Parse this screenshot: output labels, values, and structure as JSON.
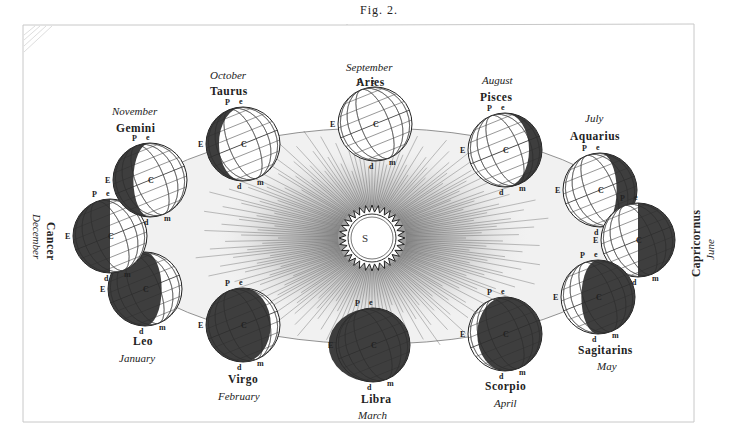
{
  "figure": {
    "title": "Fig. 2.",
    "sun_label": "S",
    "colors": {
      "background": "#ffffff",
      "ink": "#222222",
      "shade": "#2e2e2e",
      "frame": "#bdbdbd"
    },
    "point_labels": {
      "pole": "P",
      "ecliptic_pole": "e",
      "equator": "E",
      "center": "C",
      "d": "d",
      "m": "m"
    }
  },
  "positions": [
    {
      "month": "September",
      "sign": "Aries",
      "cx": 375,
      "cy": 124,
      "dark": "none"
    },
    {
      "month": "August",
      "sign": "Pisces",
      "cx": 505,
      "cy": 150,
      "dark": "right-crescent"
    },
    {
      "month": "July",
      "sign": "Aquarius",
      "cx": 600,
      "cy": 190,
      "dark": "right-third"
    },
    {
      "month": "June",
      "sign": "Capricornus",
      "cx": 638,
      "cy": 240,
      "dark": "right-half"
    },
    {
      "month": "May",
      "sign": "Sagitarins",
      "cx": 598,
      "cy": 297,
      "dark": "right-twothirds"
    },
    {
      "month": "April",
      "sign": "Scorpio",
      "cx": 505,
      "cy": 334,
      "dark": "mostly"
    },
    {
      "month": "March",
      "sign": "Libra",
      "cx": 373,
      "cy": 345,
      "dark": "full"
    },
    {
      "month": "February",
      "sign": "Virgo",
      "cx": 243,
      "cy": 325,
      "dark": "mostly-left"
    },
    {
      "month": "January",
      "sign": "Leo",
      "cx": 145,
      "cy": 289,
      "dark": "left-twothirds"
    },
    {
      "month": "December",
      "sign": "Cancer",
      "cx": 110,
      "cy": 236,
      "dark": "left-half"
    },
    {
      "month": "November",
      "sign": "Gemini",
      "cx": 150,
      "cy": 180,
      "dark": "left-third"
    },
    {
      "month": "October",
      "sign": "Taurus",
      "cx": 243,
      "cy": 144,
      "dark": "left-crescent"
    }
  ],
  "labels": {
    "september": {
      "month": "September",
      "sign": "Aries"
    },
    "august": {
      "month": "August",
      "sign": "Pisces"
    },
    "july": {
      "month": "July",
      "sign": "Aquarius"
    },
    "june": {
      "month": "June",
      "sign": "Capricornus"
    },
    "may": {
      "month": "May",
      "sign": "Sagitarins"
    },
    "april": {
      "month": "April",
      "sign": "Scorpio"
    },
    "march": {
      "month": "March",
      "sign": "Libra"
    },
    "february": {
      "month": "February",
      "sign": "Virgo"
    },
    "january": {
      "month": "January",
      "sign": "Leo"
    },
    "december": {
      "month": "December",
      "sign": "Cancer"
    },
    "november": {
      "month": "November",
      "sign": "Gemini"
    },
    "october": {
      "month": "October",
      "sign": "Taurus"
    }
  }
}
